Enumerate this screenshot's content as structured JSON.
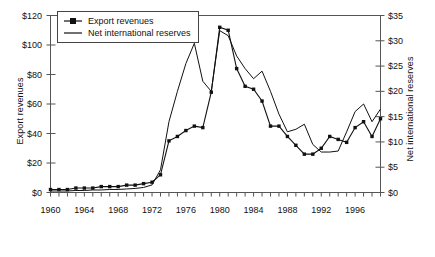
{
  "chart_data": {
    "type": "line",
    "title": "",
    "xlabel": "",
    "ylabel": "Export revenues",
    "y2label": "Net international reserves",
    "xlim": [
      1960,
      1999
    ],
    "ylim": [
      0,
      120
    ],
    "y2lim": [
      0,
      35
    ],
    "grid": false,
    "legend_position": "top-left",
    "x_ticks_labeled": [
      "1960",
      "1964",
      "1968",
      "1972",
      "1976",
      "1980",
      "1984",
      "1988",
      "1992",
      "1996"
    ],
    "x_tick_interval_years": 1,
    "y_left_ticks": [
      "$0",
      "$20",
      "$40",
      "$60",
      "$80",
      "$100",
      "$120"
    ],
    "y_right_ticks": [
      "$0",
      "$5",
      "$10",
      "$15",
      "$20",
      "$25",
      "$30",
      "$35"
    ],
    "x": [
      1960,
      1961,
      1962,
      1963,
      1964,
      1965,
      1966,
      1967,
      1968,
      1969,
      1970,
      1971,
      1972,
      1973,
      1974,
      1975,
      1976,
      1977,
      1978,
      1979,
      1980,
      1981,
      1982,
      1983,
      1984,
      1985,
      1986,
      1987,
      1988,
      1989,
      1990,
      1991,
      1992,
      1993,
      1994,
      1995,
      1996,
      1997,
      1998,
      1999
    ],
    "series": [
      {
        "name": "Export revenues",
        "axis": "left",
        "unit": "$ billions",
        "marker": "square",
        "values": [
          2,
          2,
          2,
          3,
          3,
          3,
          4,
          4,
          4,
          5,
          5,
          6,
          7,
          12,
          35,
          38,
          42,
          45,
          44,
          68,
          112,
          110,
          84,
          72,
          70,
          62,
          45,
          45,
          38,
          32,
          26,
          26,
          30,
          38,
          36,
          34,
          44,
          48,
          38,
          50
        ]
      },
      {
        "name": "Net international reserves",
        "axis": "right",
        "unit": "$ billions",
        "marker": "none",
        "values": [
          0.3,
          0.3,
          0.3,
          0.4,
          0.4,
          0.5,
          0.5,
          0.6,
          0.6,
          0.7,
          0.8,
          1.0,
          1.5,
          4.5,
          14.0,
          20.0,
          25.5,
          29.5,
          22.0,
          20.0,
          32.0,
          31.0,
          27.0,
          24.5,
          22.5,
          24.0,
          20.0,
          15.5,
          12.0,
          12.5,
          13.5,
          9.5,
          8.0,
          8.0,
          8.2,
          12.0,
          16.0,
          17.5,
          14.0,
          16.5
        ]
      }
    ]
  },
  "legend": {
    "items": [
      {
        "label": "Export revenues",
        "marker": "square-line"
      },
      {
        "label": "Net international reserves",
        "marker": "line"
      }
    ]
  }
}
